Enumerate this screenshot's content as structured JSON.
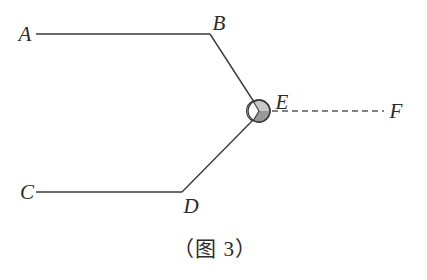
{
  "figure": {
    "caption": "（图 3）",
    "colors": {
      "line": "#3a3a3a",
      "dashed": "#555555",
      "ball_fill": "#c8c8c8",
      "ball_shade": "#8a8a8a",
      "background": "#ffffff"
    },
    "points": {
      "A": {
        "label": "A",
        "x": 36,
        "y": 34
      },
      "B": {
        "label": "B",
        "x": 210,
        "y": 34
      },
      "C": {
        "label": "C",
        "x": 36,
        "y": 192
      },
      "D": {
        "label": "D",
        "x": 182,
        "y": 192
      },
      "E": {
        "label": "E",
        "x": 259,
        "y": 111
      },
      "F": {
        "label": "F",
        "x": 386,
        "y": 111
      }
    },
    "segments": [
      {
        "from": "A",
        "to": "B",
        "style": "solid"
      },
      {
        "from": "B",
        "to": "E",
        "style": "solid"
      },
      {
        "from": "C",
        "to": "D",
        "style": "solid"
      },
      {
        "from": "D",
        "to": "E",
        "style": "solid"
      },
      {
        "from": "E",
        "to": "F",
        "style": "dashed"
      }
    ],
    "joint": {
      "at": "E",
      "shape": "ball",
      "radius": 11
    }
  }
}
